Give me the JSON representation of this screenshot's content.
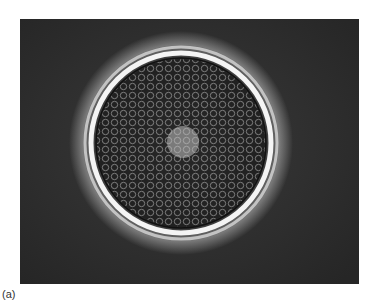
{
  "figure": {
    "panel_label": "(a)",
    "colors": {
      "background": "#2b2b2b",
      "halo": "#f2f2f2",
      "interior": "#3a3a3a"
    }
  }
}
